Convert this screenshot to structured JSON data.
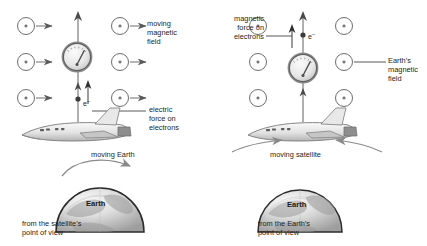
{
  "figure": {
    "background": "#ffffff",
    "ink": "#231f20"
  },
  "left_panel": {
    "name": "satellite-frame",
    "field_label": "moving\nmagnetic\nfield",
    "force_label": "electric\nforce on\nelectrons",
    "motion_label": "moving Earth",
    "caption": "from the satellite’s\npoint of view",
    "earth_label": "Earth",
    "electron_label": "e",
    "electron_charge": "–",
    "field_symbol": "circle-with-dot-and-right-arrow",
    "field_direction": "right",
    "field_rows": 3,
    "field_cols": 2,
    "instrument": "galvanometer",
    "current_direction": "up"
  },
  "right_panel": {
    "name": "earth-frame",
    "field_label": "Earth’s\nmagnetic\nfield",
    "force_label": "magnetic\nforce on\nelectrons",
    "motion_label": "moving satellite",
    "caption": "from the Earth’s\npoint of view",
    "earth_label": "Earth",
    "electron_label": "e",
    "electron_charge": "–",
    "field_symbol": "circle-with-dot",
    "field_direction": "out-of-page",
    "field_rows": 3,
    "field_cols": 2,
    "instrument": "galvanometer",
    "current_direction": "up"
  }
}
